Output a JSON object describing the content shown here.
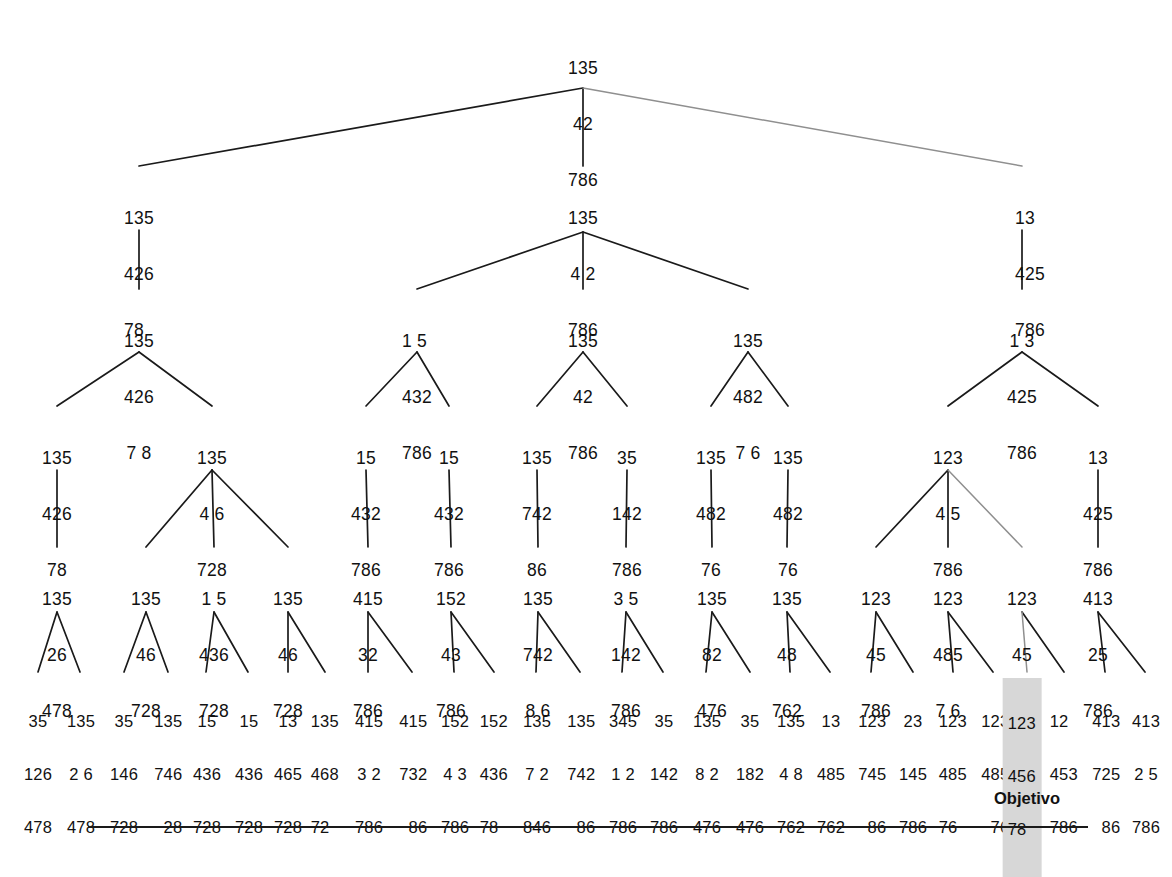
{
  "figure": {
    "goal_label": "Objetivo",
    "highlight_color": "#d7d7d7",
    "line_color": "#1a1a1a",
    "faded_line_color": "#8a8a8a"
  },
  "levels": [
    {
      "name": "level-0-root",
      "y": 22,
      "nodes": [
        {
          "id": "n0",
          "x": 583,
          "align": "center",
          "rows": [
            "135",
            "42",
            "786"
          ]
        }
      ]
    },
    {
      "name": "level-1",
      "y": 172,
      "nodes": [
        {
          "id": "n1",
          "x": 139,
          "align": "left",
          "rows": [
            "135",
            "426",
            "78"
          ]
        },
        {
          "id": "n2",
          "x": 583,
          "align": "center",
          "rows": [
            "135",
            "4 2",
            "786"
          ]
        },
        {
          "id": "n3",
          "x": 1030,
          "align": "left",
          "rows": [
            "13",
            "425",
            "786"
          ]
        }
      ]
    },
    {
      "name": "level-2",
      "y": 295,
      "nodes": [
        {
          "id": "n4",
          "x": 139,
          "align": "center",
          "rows": [
            "135",
            "426",
            "7 8"
          ]
        },
        {
          "id": "n5",
          "x": 417,
          "align": "left",
          "rows": [
            "1 5",
            "432",
            "786"
          ]
        },
        {
          "id": "n6",
          "x": 583,
          "align": "center",
          "rows": [
            "135",
            "42",
            "786"
          ]
        },
        {
          "id": "n7",
          "x": 748,
          "align": "center",
          "rows": [
            "135",
            "482",
            "7 6"
          ]
        },
        {
          "id": "n8",
          "x": 1022,
          "align": "center",
          "rows": [
            "1 3",
            "425",
            "786"
          ]
        }
      ]
    },
    {
      "name": "level-3",
      "y": 412,
      "nodes": [
        {
          "id": "n9",
          "x": 57,
          "align": "center",
          "rows": [
            "135",
            "426",
            "78"
          ]
        },
        {
          "id": "n10",
          "x": 212,
          "align": "center",
          "rows": [
            "135",
            "4 6",
            "728"
          ]
        },
        {
          "id": "n11",
          "x": 366,
          "align": "center",
          "rows": [
            "15",
            "432",
            "786"
          ]
        },
        {
          "id": "n12",
          "x": 449,
          "align": "center",
          "rows": [
            "15",
            "432",
            "786"
          ]
        },
        {
          "id": "n13",
          "x": 537,
          "align": "center",
          "rows": [
            "135",
            "742",
            "86"
          ]
        },
        {
          "id": "n14",
          "x": 627,
          "align": "center",
          "rows": [
            "35",
            "142",
            "786"
          ]
        },
        {
          "id": "n15",
          "x": 711,
          "align": "center",
          "rows": [
            "135",
            "482",
            "76"
          ]
        },
        {
          "id": "n16",
          "x": 788,
          "align": "center",
          "rows": [
            "135",
            "482",
            "76"
          ]
        },
        {
          "id": "n17",
          "x": 948,
          "align": "center",
          "rows": [
            "123",
            "4 5",
            "786"
          ]
        },
        {
          "id": "n18",
          "x": 1098,
          "align": "center",
          "rows": [
            "13",
            "425",
            "786"
          ]
        }
      ]
    },
    {
      "name": "level-4",
      "y": 553,
      "nodes": [
        {
          "id": "n19",
          "x": 57,
          "align": "center",
          "rows": [
            "135",
            "26",
            "478"
          ]
        },
        {
          "id": "n20",
          "x": 146,
          "align": "center",
          "rows": [
            "135",
            "46",
            "728"
          ]
        },
        {
          "id": "n21",
          "x": 214,
          "align": "center",
          "rows": [
            "1 5",
            "436",
            "728"
          ]
        },
        {
          "id": "n22",
          "x": 288,
          "align": "center",
          "rows": [
            "135",
            "46",
            "728"
          ]
        },
        {
          "id": "n23",
          "x": 368,
          "align": "center",
          "rows": [
            "415",
            "32",
            "786"
          ]
        },
        {
          "id": "n24",
          "x": 451,
          "align": "center",
          "rows": [
            "152",
            "43",
            "786"
          ]
        },
        {
          "id": "n25",
          "x": 538,
          "align": "center",
          "rows": [
            "135",
            "742",
            "8 6"
          ]
        },
        {
          "id": "n26",
          "x": 626,
          "align": "center",
          "rows": [
            "3 5",
            "142",
            "786"
          ]
        },
        {
          "id": "n27",
          "x": 712,
          "align": "center",
          "rows": [
            "135",
            "82",
            "476"
          ]
        },
        {
          "id": "n28",
          "x": 787,
          "align": "center",
          "rows": [
            "135",
            "48",
            "762"
          ]
        },
        {
          "id": "n29",
          "x": 876,
          "align": "center",
          "rows": [
            "123",
            "45",
            "786"
          ]
        },
        {
          "id": "n30",
          "x": 948,
          "align": "center",
          "rows": [
            "123",
            "485",
            "7 6"
          ]
        },
        {
          "id": "n31",
          "x": 1022,
          "align": "center",
          "rows": [
            "123",
            "45",
            "786"
          ]
        },
        {
          "id": "n32",
          "x": 1098,
          "align": "center",
          "rows": [
            "413",
            "25",
            "786"
          ]
        }
      ]
    },
    {
      "name": "level-5-leaves",
      "y": 678,
      "nodes": [
        {
          "id": "l1",
          "x": 38,
          "align": "center",
          "rows": [
            "35",
            "126",
            "478"
          ]
        },
        {
          "id": "l2",
          "x": 80,
          "align": "center",
          "rows": [
            "135",
            "2 6",
            "478"
          ]
        },
        {
          "id": "l3",
          "x": 124,
          "align": "center",
          "rows": [
            "35",
            "146",
            "728"
          ]
        },
        {
          "id": "l4",
          "x": 168,
          "align": "center",
          "rows": [
            "135",
            "746",
            "28"
          ]
        },
        {
          "id": "l5",
          "x": 206,
          "align": "center",
          "rows": [
            "15",
            "436",
            "728"
          ]
        },
        {
          "id": "l6",
          "x": 248,
          "align": "center",
          "rows": [
            "15",
            "436",
            "728"
          ]
        },
        {
          "id": "l7",
          "x": 288,
          "align": "center",
          "rows": [
            "13",
            "465",
            "728"
          ]
        },
        {
          "id": "l8",
          "x": 325,
          "align": "center",
          "rows": [
            "135",
            "468",
            "72"
          ]
        },
        {
          "id": "l9",
          "x": 368,
          "align": "center",
          "rows": [
            "415",
            "3 2",
            "786"
          ]
        },
        {
          "id": "l10",
          "x": 412,
          "align": "center",
          "rows": [
            "415",
            "732",
            "86"
          ]
        },
        {
          "id": "l11",
          "x": 454,
          "align": "center",
          "rows": [
            "152",
            "4 3",
            "786"
          ]
        },
        {
          "id": "l12",
          "x": 494,
          "align": "center",
          "rows": [
            "152",
            "436",
            "78"
          ]
        },
        {
          "id": "l13",
          "x": 536,
          "align": "center",
          "rows": [
            "135",
            "7 2",
            "846"
          ]
        },
        {
          "id": "l14",
          "x": 580,
          "align": "center",
          "rows": [
            "135",
            "742",
            "86"
          ]
        },
        {
          "id": "l15",
          "x": 622,
          "align": "center",
          "rows": [
            "345",
            "1 2",
            "786"
          ]
        },
        {
          "id": "l16",
          "x": 663,
          "align": "center",
          "rows": [
            "35",
            "142",
            "786"
          ]
        },
        {
          "id": "l17",
          "x": 706,
          "align": "center",
          "rows": [
            "135",
            "8 2",
            "476"
          ]
        },
        {
          "id": "l18",
          "x": 750,
          "align": "center",
          "rows": [
            "35",
            "182",
            "476"
          ]
        },
        {
          "id": "l19",
          "x": 790,
          "align": "center",
          "rows": [
            "135",
            "4 8",
            "762"
          ]
        },
        {
          "id": "l20",
          "x": 830,
          "align": "center",
          "rows": [
            "13",
            "485",
            "762"
          ]
        },
        {
          "id": "l21",
          "x": 871,
          "align": "center",
          "rows": [
            "123",
            "745",
            "86"
          ]
        },
        {
          "id": "l22",
          "x": 913,
          "align": "center",
          "rows": [
            "23",
            "145",
            "786"
          ]
        },
        {
          "id": "l23",
          "x": 953,
          "align": "center",
          "rows": [
            "123",
            "485",
            "76"
          ]
        },
        {
          "id": "l24",
          "x": 993,
          "align": "center",
          "rows": [
            "123",
            "485",
            "76"
          ]
        },
        {
          "id": "l25",
          "x": 1027,
          "align": "center",
          "rows": [
            "123",
            "456",
            "78"
          ],
          "highlight": true
        },
        {
          "id": "l26",
          "x": 1064,
          "align": "center",
          "rows": [
            "12",
            "453",
            "786"
          ]
        },
        {
          "id": "l27",
          "x": 1105,
          "align": "center",
          "rows": [
            "413",
            "725",
            "86"
          ]
        },
        {
          "id": "l28",
          "x": 1145,
          "align": "center",
          "rows": [
            "413",
            "2 5",
            "786"
          ]
        }
      ]
    }
  ],
  "goal_marker": {
    "x": 1027,
    "y": 795,
    "label": "Objetivo"
  },
  "rule": {
    "x": 88,
    "y": 826,
    "width": 1000
  }
}
